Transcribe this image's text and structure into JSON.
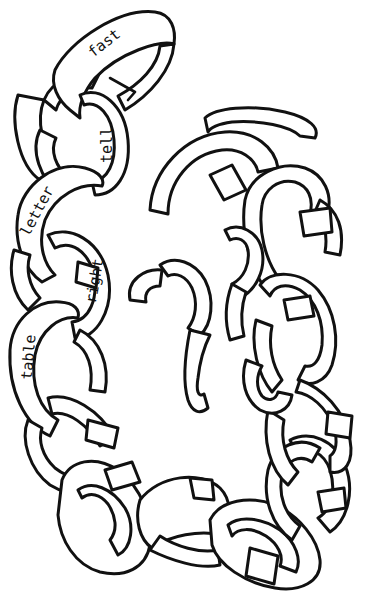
{
  "illustration": {
    "subject": "paper chain",
    "background": "#ffffff",
    "line_color": "#111111",
    "words": [
      {
        "text": "fast",
        "x": 103,
        "y": 45,
        "rotate": -38
      },
      {
        "text": "tell",
        "x": 107,
        "y": 145,
        "rotate": -90
      },
      {
        "text": "letter",
        "x": 36,
        "y": 212,
        "rotate": -62
      },
      {
        "text": "right",
        "x": 93,
        "y": 282,
        "rotate": -80
      },
      {
        "text": "table",
        "x": 28,
        "y": 358,
        "rotate": -85
      }
    ]
  }
}
